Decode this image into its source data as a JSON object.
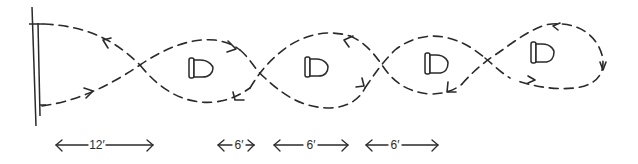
{
  "diagram": {
    "start_line": "start-line",
    "cones": [
      {
        "id": "cone-1",
        "icon": "cone-icon"
      },
      {
        "id": "cone-2",
        "icon": "cone-icon"
      },
      {
        "id": "cone-3",
        "icon": "cone-icon"
      },
      {
        "id": "cone-4",
        "icon": "cone-icon"
      }
    ],
    "dimensions": [
      {
        "label": "12′"
      },
      {
        "label": "6′"
      },
      {
        "label": "6′"
      },
      {
        "label": "6′"
      }
    ],
    "colors": {
      "ink": "#2a2a2a",
      "background": "#ffffff"
    }
  }
}
